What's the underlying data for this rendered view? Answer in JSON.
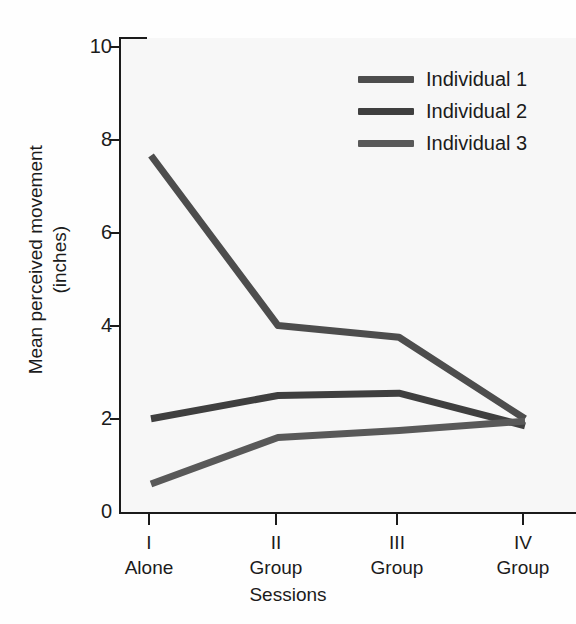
{
  "chart_data": {
    "type": "line",
    "title": "",
    "xlabel": "Sessions",
    "ylabel": "Mean perceived movement (inches)",
    "ylabel_line1": "Mean perceived movement",
    "ylabel_line2": "(inches)",
    "categories": [
      "I",
      "II",
      "III",
      "IV"
    ],
    "category_conditions": [
      "Alone",
      "Group",
      "Group",
      "Group"
    ],
    "xtick_labels": [
      "I",
      "II",
      "III",
      "IV"
    ],
    "ytick_labels": [
      "0",
      "2",
      "4",
      "6",
      "8",
      "10"
    ],
    "yticks": [
      0,
      2,
      4,
      6,
      8,
      10
    ],
    "ylim": [
      0,
      10
    ],
    "grid": false,
    "legend_position": "top-right",
    "series": [
      {
        "name": "Individual 1",
        "values": [
          7.65,
          4.0,
          3.75,
          2.0
        ],
        "color": "#4d4d4d"
      },
      {
        "name": "Individual 2",
        "values": [
          2.0,
          2.5,
          2.55,
          1.85
        ],
        "color": "#3f3f3f"
      },
      {
        "name": "Individual 3",
        "values": [
          0.6,
          1.6,
          1.75,
          1.95
        ],
        "color": "#595959"
      }
    ]
  },
  "legend": {
    "items": [
      {
        "label": "Individual 1",
        "color": "#4d4d4d"
      },
      {
        "label": "Individual 2",
        "color": "#3f3f3f"
      },
      {
        "label": "Individual 3",
        "color": "#595959"
      }
    ]
  },
  "axes": {
    "x_title": "Sessions",
    "y_title_line1": "Mean perceived movement",
    "y_title_line2": "(inches)"
  },
  "colors": {
    "ink": "#1b1b1b",
    "plot_background": "#f7f7f7",
    "page_background": "#fefefe"
  }
}
